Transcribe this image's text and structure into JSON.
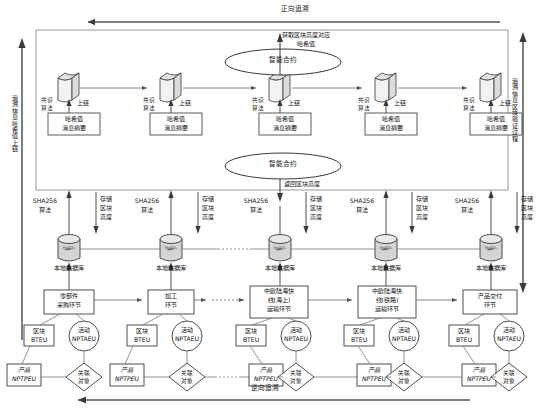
{
  "diagram": {
    "title_forward": "正向追溯",
    "title_reverse": "逆向追溯",
    "axis_left": "追溯信息哈希值上链",
    "axis_right": "追溯信息区块验证过程"
  },
  "chain": {
    "consensus_label": "共识\n算法",
    "consensus_line1": "共识",
    "consensus_line2": "算法",
    "onchain_label": "上链",
    "hash_line1": "哈希值",
    "hash_line2": "消息摘要",
    "nodes": [
      {
        "id": "node-1"
      },
      {
        "id": "node-2"
      },
      {
        "id": "node-3"
      },
      {
        "id": "node-4"
      },
      {
        "id": "node-5"
      }
    ]
  },
  "contract": {
    "upper_label": "智能合约",
    "lower_label": "智能合约",
    "get_hash_line1": "获取区块高度对应",
    "get_hash_line2": "哈希值",
    "return_height": "返回区块高度"
  },
  "storage": {
    "sha_line1": "SHA256",
    "sha_line2": "算法",
    "store_line1": "存储",
    "store_line2": "区块",
    "store_line3": "高度",
    "db_label": "本地数据库",
    "db_logo": "MySQL",
    "items": [
      {
        "sha": "SHA256",
        "db": "本地数据库"
      },
      {
        "sha": "SHA256",
        "db": "本地数据库"
      },
      {
        "sha": "SHA256",
        "db": "本地数据库"
      },
      {
        "sha": "SHA256",
        "db": "本地数据库"
      },
      {
        "sha": "SHA256",
        "db": "本地数据库"
      }
    ]
  },
  "stages": [
    {
      "id": "stage-1",
      "name_line1": "零部件",
      "name_line2": "采购环节",
      "name_line3": "",
      "block": "区块\nBTEU",
      "block_l1": "区块",
      "block_l2": "BTEU",
      "activity_l1": "活动",
      "activity_l2": "NPTAEU",
      "product_l1": "产品",
      "product_l2": "NPTPEU",
      "relation_l1": "关联",
      "relation_l2": "对象"
    },
    {
      "id": "stage-2",
      "name_line1": "加工",
      "name_line2": "环节",
      "name_line3": "",
      "block_l1": "区块",
      "block_l2": "BTEU",
      "activity_l1": "活动",
      "activity_l2": "NPTAEU",
      "product_l1": "产品",
      "product_l2": "NPTPEU",
      "relation_l1": "关联",
      "relation_l2": "对象"
    },
    {
      "id": "stage-3",
      "name_line1": "中欧陆海快",
      "name_line2": "线(海上)",
      "name_line3": "运输环节",
      "block_l1": "区块",
      "block_l2": "BTEU",
      "activity_l1": "活动",
      "activity_l2": "NPTAEU",
      "product_l1": "产品",
      "product_l2": "NPTPEU",
      "relation_l1": "关联",
      "relation_l2": "对象"
    },
    {
      "id": "stage-4",
      "name_line1": "中欧陆海快",
      "name_line2": "线(铁路)",
      "name_line3": "运输环节",
      "block_l1": "区块",
      "block_l2": "BTEU",
      "activity_l1": "活动",
      "activity_l2": "NPTAEU",
      "product_l1": "产品",
      "product_l2": "NPTPEU",
      "relation_l1": "关联",
      "relation_l2": "对象"
    },
    {
      "id": "stage-5",
      "name_line1": "产品交付",
      "name_line2": "环节",
      "name_line3": "",
      "block_l1": "区块",
      "block_l2": "BTEU",
      "activity_l1": "活动",
      "activity_l2": "NPTAEU",
      "product_l1": "产品",
      "product_l2": "NPTPEU",
      "relation_l1": "关联",
      "relation_l2": "对象"
    }
  ],
  "colors": {
    "line": "#6e6e6e",
    "dark_line": "#4a4a4a",
    "block_fill": "#efefef",
    "db_fill": "#d9d9d9",
    "text": "#111111"
  }
}
